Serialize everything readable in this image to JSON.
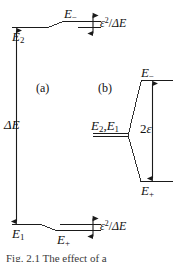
{
  "figure": {
    "background": "#ffffff",
    "line_color": "#1a1a1a",
    "panels": [
      {
        "id": "a",
        "label": "(a)",
        "levels": [
          {
            "name": "E2",
            "label_main": "E",
            "label_sub": "2"
          },
          {
            "name": "E-minus",
            "label_main": "E",
            "label_sub": "−"
          },
          {
            "name": "E1",
            "label_main": "E",
            "label_sub": "1"
          },
          {
            "name": "E-plus",
            "label_main": "E",
            "label_sub": "+"
          }
        ],
        "arrows": [
          {
            "name": "delta-E",
            "label_main": "ΔE"
          },
          {
            "name": "shift-top",
            "label_num": "ε",
            "label_sup": "2",
            "label_den": "ΔE"
          },
          {
            "name": "shift-bottom",
            "label_num": "ε",
            "label_sup": "2",
            "label_den": "ΔE"
          }
        ]
      },
      {
        "id": "b",
        "label": "(b)",
        "levels": [
          {
            "name": "E2-E1-degenerate",
            "label_main": "E",
            "label_sub": "2",
            "label_main2": "E",
            "label_sub2": "1"
          },
          {
            "name": "E-minus",
            "label_main": "E",
            "label_sub": "−"
          },
          {
            "name": "E-plus",
            "label_main": "E",
            "label_sub": "+"
          }
        ],
        "arrows": [
          {
            "name": "two-epsilon",
            "label_num": "2",
            "label_sym": "ε"
          }
        ]
      }
    ],
    "labels": {
      "panel_a": "(a)",
      "panel_b": "(b)",
      "E2": "E",
      "E2_sub": "2",
      "E1": "E",
      "E1_sub": "1",
      "E_minus": "E",
      "E_minus_sub": "−",
      "E_plus": "E",
      "E_plus_sub": "+",
      "delta_E": "ΔE",
      "eps_num": "ε",
      "eps_sup": "2",
      "eps_slash": "/",
      "eps_den": "ΔE",
      "two": "2",
      "epsilon": "ε",
      "degenerate_E2": "E",
      "degenerate_E2_sub": "2",
      "degenerate_comma": ",",
      "degenerate_E1": "E",
      "degenerate_E1_sub": "1"
    },
    "caption": "Fig. 2.1   The effect of a"
  }
}
